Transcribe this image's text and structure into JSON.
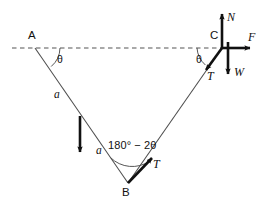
{
  "figure": {
    "type": "free-body-diagram",
    "colors": {
      "line": "#4d4d4d",
      "vector": "#111111",
      "dashed": "#555555",
      "text": "#111111",
      "background": "#ffffff"
    },
    "points": {
      "a": {
        "label": "A",
        "x": 35,
        "y": 48
      },
      "b": {
        "label": "B",
        "x": 128,
        "y": 183
      },
      "c": {
        "label": "C",
        "x": 222,
        "y": 48
      }
    },
    "angles": {
      "at_a": "θ",
      "at_c": "θ",
      "at_b": "180° − 2θ"
    },
    "sides": {
      "upper_segment": "a",
      "lower_segment": "a"
    },
    "vectors": {
      "normal": "N",
      "friction": "F",
      "weight": "W",
      "tension_at_c": "T",
      "tension_at_b": "T"
    }
  }
}
